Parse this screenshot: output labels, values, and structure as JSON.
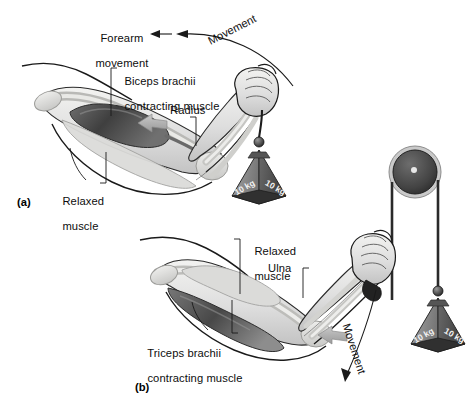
{
  "figure": {
    "type": "anatomical-diagram",
    "background": "#ffffff",
    "ink": "#0d0d0d"
  },
  "panels": [
    {
      "id": "a",
      "id_label": "(a)",
      "description": "Flexed arm, biceps brachii contracting, forearm raised lifting a 10 kg pyramid weight",
      "labels": [
        {
          "name": "forearm-movement",
          "text": "Forearm\nmovement",
          "line1": "Forearm",
          "line2": "movement"
        },
        {
          "name": "movement-curve",
          "text": "Movement"
        },
        {
          "name": "biceps-brachii",
          "text": "Biceps brachii\ncontracting muscle",
          "line1": "Biceps brachii",
          "line2": "contracting muscle"
        },
        {
          "name": "radius",
          "text": "Radius"
        },
        {
          "name": "relaxed-muscle",
          "text": "Relaxed\nmuscle",
          "line1": "Relaxed",
          "line2": "muscle"
        }
      ]
    },
    {
      "id": "b",
      "id_label": "(b)",
      "description": "Extending arm, triceps brachii contracting, forearm lowering via a rope over a pulley attached to a 10 kg pyramid weight",
      "labels": [
        {
          "name": "relaxed-muscle",
          "text": "Relaxed\nmuscle",
          "line1": "Relaxed",
          "line2": "muscle"
        },
        {
          "name": "ulna",
          "text": "Ulna"
        },
        {
          "name": "triceps-brachii",
          "text": "Triceps brachii\ncontracting muscle",
          "line1": "Triceps brachii",
          "line2": "contracting muscle"
        },
        {
          "name": "movement-curve",
          "text": "Movement"
        }
      ]
    }
  ],
  "weights": [
    {
      "name": "weight-upper",
      "face_left": "10 kg",
      "face_right": "10 kg",
      "shape": "pyramid",
      "mass": "10 kg"
    },
    {
      "name": "weight-lower",
      "face_left": "10 kg",
      "face_right": "10 kg",
      "shape": "pyramid",
      "mass": "10 kg"
    }
  ],
  "apparatus": {
    "pulley": {
      "name": "pulley-wheel",
      "description": "dark circular pulley wheel with light rim and center hub"
    },
    "rope": {
      "name": "rope",
      "description": "rope running from hand over pulley down to hanging weight"
    }
  },
  "colors": {
    "muscle_dark": "#4a4a4a",
    "muscle_mid": "#8a8a8a",
    "bone_light": "#d8d8d4",
    "weight_left": "#8f8f8f",
    "weight_right": "#5c5c5c",
    "arrow_gray": "#a9a9a9",
    "outline": "#1a1a1a"
  }
}
